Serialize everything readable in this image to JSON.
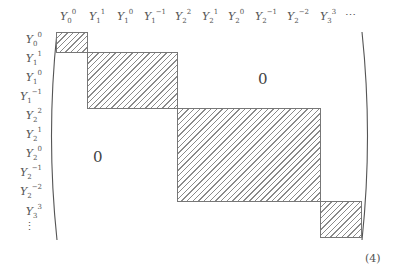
{
  "matrix": {
    "column_labels": [
      {
        "base": "Y",
        "sub": "0",
        "sup": "0"
      },
      {
        "base": "Y",
        "sub": "1",
        "sup": "1"
      },
      {
        "base": "Y",
        "sub": "1",
        "sup": "0"
      },
      {
        "base": "Y",
        "sub": "1",
        "sup": "−1"
      },
      {
        "base": "Y",
        "sub": "2",
        "sup": "2"
      },
      {
        "base": "Y",
        "sub": "2",
        "sup": "1"
      },
      {
        "base": "Y",
        "sub": "2",
        "sup": "0"
      },
      {
        "base": "Y",
        "sub": "2",
        "sup": "−1"
      },
      {
        "base": "Y",
        "sub": "2",
        "sup": "−2"
      },
      {
        "base": "Y",
        "sub": "3",
        "sup": "3"
      }
    ],
    "column_ellipsis": "⋯",
    "row_labels": [
      {
        "base": "Y",
        "sub": "0",
        "sup": "0"
      },
      {
        "base": "Y",
        "sub": "1",
        "sup": "1"
      },
      {
        "base": "Y",
        "sub": "1",
        "sup": "0"
      },
      {
        "base": "Y",
        "sub": "1",
        "sup": "−1"
      },
      {
        "base": "Y",
        "sub": "2",
        "sup": "2"
      },
      {
        "base": "Y",
        "sub": "2",
        "sup": "1"
      },
      {
        "base": "Y",
        "sub": "2",
        "sup": "0"
      },
      {
        "base": "Y",
        "sub": "2",
        "sup": "−1"
      },
      {
        "base": "Y",
        "sub": "2",
        "sup": "−2"
      },
      {
        "base": "Y",
        "sub": "3",
        "sup": "3"
      }
    ],
    "row_ellipsis": "⋮",
    "upper_zero": "0",
    "lower_zero": "0",
    "blocks": [
      {
        "l": 0,
        "size": 1
      },
      {
        "l": 1,
        "size": 3
      },
      {
        "l": 2,
        "size": 5
      },
      {
        "l": 3,
        "size": 7
      }
    ]
  },
  "equation_number": "(4)"
}
